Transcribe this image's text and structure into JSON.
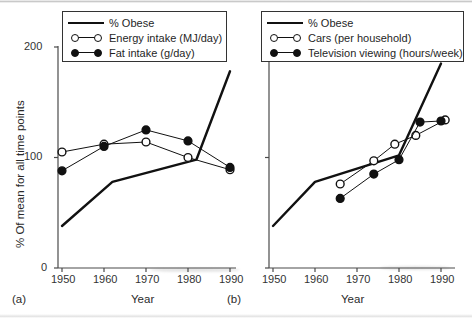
{
  "figure": {
    "y_axis_label": "% Of mean for all time points",
    "x_axis_label": "Year",
    "y_ticks": [
      "0",
      "100",
      "200"
    ],
    "y_tick_values": [
      0,
      100,
      200
    ],
    "x_ticks": [
      "1950",
      "1960",
      "1970",
      "1980",
      "1990"
    ],
    "x_tick_values": [
      1950,
      1960,
      1970,
      1980,
      1990
    ],
    "panel_a_label": "(a)",
    "panel_b_label": "(b)",
    "line_color": "#111111",
    "marker_open_fill": "#ffffff",
    "marker_closed_fill": "#111111"
  },
  "chart_data": [
    {
      "type": "line",
      "panel": "(a)",
      "title": "",
      "xlabel": "Year",
      "ylabel": "% Of mean for all time points",
      "xlim": [
        1948,
        1992
      ],
      "ylim": [
        0,
        215
      ],
      "grid": false,
      "legend_position": "top-center",
      "series": [
        {
          "name": "% Obese",
          "marker": "none",
          "style": "thick-line",
          "x": [
            1950,
            1962,
            1982,
            1990
          ],
          "values": [
            38,
            78,
            98,
            178
          ]
        },
        {
          "name": "Energy intake (MJ/day)",
          "marker": "open-circle",
          "style": "thin-line",
          "x": [
            1950,
            1960,
            1970,
            1980,
            1990
          ],
          "values": [
            105,
            112,
            114,
            100,
            89
          ]
        },
        {
          "name": "Fat intake (g/day)",
          "marker": "closed-circle",
          "style": "thin-line",
          "x": [
            1950,
            1960,
            1970,
            1980,
            1990
          ],
          "values": [
            88,
            110,
            125,
            115,
            91
          ]
        }
      ]
    },
    {
      "type": "line",
      "panel": "(b)",
      "title": "",
      "xlabel": "Year",
      "ylabel": "% Of mean for all time points",
      "xlim": [
        1948,
        1992
      ],
      "ylim": [
        0,
        215
      ],
      "grid": false,
      "legend_position": "top-center",
      "series": [
        {
          "name": "% Obese",
          "marker": "none",
          "style": "thick-line",
          "x": [
            1950,
            1960,
            1980,
            1990
          ],
          "values": [
            38,
            78,
            102,
            185
          ]
        },
        {
          "name": "Cars (per household)",
          "marker": "open-circle",
          "style": "thin-line",
          "x": [
            1966,
            1974,
            1979,
            1984,
            1991
          ],
          "values": [
            76,
            97,
            112,
            120,
            134
          ]
        },
        {
          "name": "Television viewing (hours/week)",
          "marker": "closed-circle",
          "style": "thin-line",
          "x": [
            1966,
            1974,
            1980,
            1985,
            1990
          ],
          "values": [
            63,
            85,
            98,
            132,
            133
          ]
        }
      ]
    }
  ],
  "panel_a": {
    "legend": {
      "items": [
        {
          "label": "% Obese",
          "key": "thick-line"
        },
        {
          "label": "Energy intake (MJ/day)",
          "key": "open-circle-line"
        },
        {
          "label": "Fat intake (g/day)",
          "key": "closed-circle-line"
        }
      ]
    }
  },
  "panel_b": {
    "legend": {
      "items": [
        {
          "label": "% Obese",
          "key": "thick-line"
        },
        {
          "label": "Cars (per household)",
          "key": "open-circle-line"
        },
        {
          "label": "Television viewing (hours/week)",
          "key": "closed-circle-line"
        }
      ]
    }
  }
}
